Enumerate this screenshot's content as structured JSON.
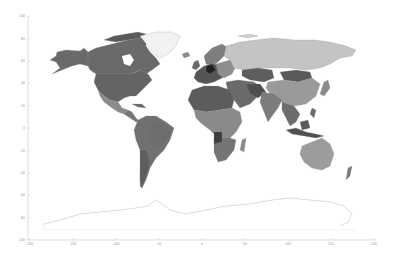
{
  "chart_data": {
    "type": "choropleth-map",
    "title": "",
    "xlabel": "",
    "ylabel": "",
    "xlim": [
      -200,
      200
    ],
    "ylim": [
      -100,
      100
    ],
    "grid": false,
    "legend": null,
    "colormap": "grayscale",
    "x_ticks": [
      -200,
      -150,
      -100,
      -50,
      0,
      50,
      100,
      150,
      200
    ],
    "y_ticks": [
      100,
      80,
      60,
      40,
      20,
      0,
      -20,
      -40,
      -60,
      -80,
      -100
    ],
    "regions": [
      {
        "name": "Canada",
        "shade": "#6a6a6a"
      },
      {
        "name": "United States",
        "shade": "#646464"
      },
      {
        "name": "Alaska",
        "shade": "#6a6a6a"
      },
      {
        "name": "Greenland",
        "shade": "#f2f2f2"
      },
      {
        "name": "Mexico",
        "shade": "#8c8c8c"
      },
      {
        "name": "Central America",
        "shade": "#777777"
      },
      {
        "name": "South America",
        "shade": "#707070"
      },
      {
        "name": "Brazil",
        "shade": "#6e6e6e"
      },
      {
        "name": "Argentina/Chile",
        "shade": "#7a7a7a"
      },
      {
        "name": "Western Europe",
        "shade": "#555555"
      },
      {
        "name": "Scandinavia",
        "shade": "#7e7e7e"
      },
      {
        "name": "Russia",
        "shade": "#c4c4c4"
      },
      {
        "name": "Kazakhstan",
        "shade": "#5e5e5e"
      },
      {
        "name": "Mongolia",
        "shade": "#5a5a5a"
      },
      {
        "name": "China",
        "shade": "#9a9a9a"
      },
      {
        "name": "India",
        "shade": "#7c7c7c"
      },
      {
        "name": "Middle East",
        "shade": "#6a6a6a"
      },
      {
        "name": "North Africa",
        "shade": "#5c5c5c"
      },
      {
        "name": "Central Africa",
        "shade": "#8a8a8a"
      },
      {
        "name": "Southern Africa",
        "shade": "#747474"
      },
      {
        "name": "Southeast Asia",
        "shade": "#6c6c6c"
      },
      {
        "name": "Australia",
        "shade": "#9c9c9c"
      },
      {
        "name": "New Zealand",
        "shade": "#7a7a7a"
      },
      {
        "name": "Japan",
        "shade": "#8a8a8a"
      },
      {
        "name": "Antarctica",
        "shade": "#ffffff"
      }
    ]
  },
  "axes": {
    "x_tick_labels": [
      "-200",
      "-150",
      "-100",
      "-50",
      "0",
      "50",
      "100",
      "150",
      "200"
    ],
    "y_tick_labels": [
      "100",
      "80",
      "60",
      "40",
      "20",
      "0",
      "-20",
      "-40",
      "-60",
      "-80",
      "-100"
    ]
  }
}
